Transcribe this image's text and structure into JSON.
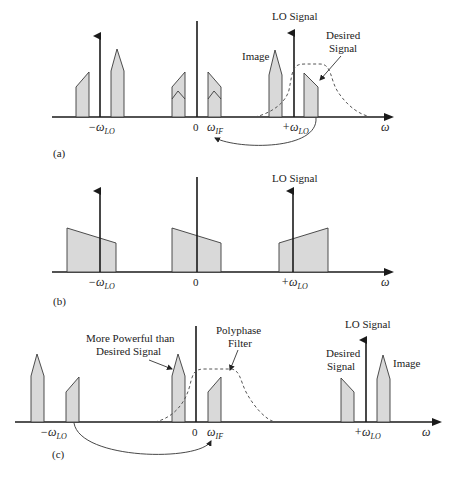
{
  "figure": {
    "panels": [
      {
        "id": "a",
        "caption": "(a)",
        "axis_label": "ω",
        "ticks": [
          {
            "label_main": "−ω",
            "label_sub": "LO"
          },
          {
            "label_main": "0",
            "label_sub": ""
          },
          {
            "label_main": "ω",
            "label_sub": "IF"
          },
          {
            "label_main": "+ω",
            "label_sub": "LO"
          }
        ],
        "annotations": {
          "lo_signal": "LO Signal",
          "image": "Image",
          "desired_line1": "Desired",
          "desired_line2": "Signal"
        }
      },
      {
        "id": "b",
        "caption": "(b)",
        "axis_label": "ω",
        "ticks": [
          {
            "label_main": "−ω",
            "label_sub": "LO"
          },
          {
            "label_main": "0",
            "label_sub": ""
          },
          {
            "label_main": "+ω",
            "label_sub": "LO"
          }
        ],
        "annotations": {
          "lo_signal": "LO Signal"
        }
      },
      {
        "id": "c",
        "caption": "(c)",
        "axis_label": "ω",
        "ticks": [
          {
            "label_main": "−ω",
            "label_sub": "LO"
          },
          {
            "label_main": "0",
            "label_sub": ""
          },
          {
            "label_main": "ω",
            "label_sub": "IF"
          },
          {
            "label_main": "+ω",
            "label_sub": "LO"
          }
        ],
        "annotations": {
          "powerful_line1": "More Powerful than",
          "powerful_line2": "Desired Signal",
          "polyphase_line1": "Polyphase",
          "polyphase_line2": "Filter",
          "lo_signal": "LO Signal",
          "desired_line1": "Desired",
          "desired_line2": "Signal",
          "image": "Image"
        }
      }
    ],
    "colors": {
      "spectrum_fill": "#d9d9d9",
      "line": "#1a1a1a",
      "filter_dash": "#555555"
    }
  }
}
